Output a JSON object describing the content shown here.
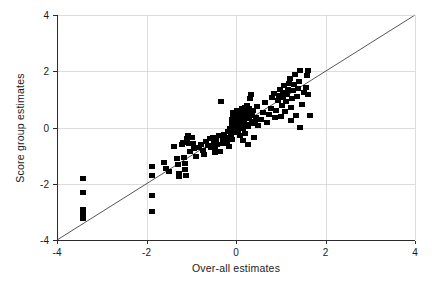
{
  "chart_data": {
    "type": "scatter",
    "title": "",
    "xlabel": "Over-all estimates",
    "ylabel": "Score group estimates",
    "xlim": [
      -4,
      4
    ],
    "ylim": [
      -4,
      4
    ],
    "xticks": [
      -4,
      -2,
      0,
      2,
      4
    ],
    "yticks": [
      -4,
      -2,
      0,
      2,
      4
    ],
    "xtick_labels": [
      "-4",
      "-2",
      "0",
      "2",
      "4"
    ],
    "ytick_labels": [
      "-4",
      "-2",
      "0",
      "2",
      "4"
    ],
    "grid": true,
    "grid_axes": "both",
    "legend": null,
    "legend_position": "none",
    "marker": "square",
    "marker_color": "#000000",
    "marker_size_px": 6,
    "reference_line": {
      "name": "identity-line",
      "type": "line",
      "slope": 1,
      "intercept": 0,
      "from": [
        -4,
        -4
      ],
      "to": [
        4,
        4
      ],
      "color": "#2b2b2b"
    },
    "series": [
      {
        "name": "estimates",
        "points": [
          [
            -3.42,
            -1.83
          ],
          [
            -3.42,
            -2.3
          ],
          [
            -3.42,
            -2.92
          ],
          [
            -3.42,
            -3.08
          ],
          [
            -3.42,
            -3.22
          ],
          [
            -1.87,
            -1.4
          ],
          [
            -1.87,
            -1.72
          ],
          [
            -1.87,
            -2.41
          ],
          [
            -1.87,
            -3.0
          ],
          [
            -1.6,
            -1.23
          ],
          [
            -1.56,
            -1.46
          ],
          [
            -1.49,
            -1.56
          ],
          [
            -1.38,
            -0.68
          ],
          [
            -1.31,
            -1.1
          ],
          [
            -1.29,
            -1.3
          ],
          [
            -1.27,
            -1.62
          ],
          [
            -1.27,
            -1.74
          ],
          [
            -1.2,
            -0.62
          ],
          [
            -1.18,
            -0.52
          ],
          [
            -1.16,
            -1.08
          ],
          [
            -1.14,
            -1.28
          ],
          [
            -1.13,
            -1.5
          ],
          [
            -1.12,
            -1.7
          ],
          [
            -1.09,
            -0.38
          ],
          [
            -1.07,
            -0.3
          ],
          [
            -1.05,
            -0.58
          ],
          [
            -1.02,
            -0.86
          ],
          [
            -0.98,
            -0.34
          ],
          [
            -0.96,
            -0.56
          ],
          [
            -0.93,
            -0.74
          ],
          [
            -0.9,
            -1.02
          ],
          [
            -0.82,
            -0.72
          ],
          [
            -0.78,
            -0.6
          ],
          [
            -0.74,
            -0.82
          ],
          [
            -0.71,
            -0.95
          ],
          [
            -0.66,
            -0.48
          ],
          [
            -0.62,
            -0.64
          ],
          [
            -0.58,
            -0.4
          ],
          [
            -0.56,
            -0.7
          ],
          [
            -0.52,
            -0.36
          ],
          [
            -0.5,
            -0.52
          ],
          [
            -0.48,
            -0.78
          ],
          [
            -0.46,
            -0.9
          ],
          [
            -0.44,
            -0.44
          ],
          [
            -0.42,
            -0.62
          ],
          [
            -0.38,
            -0.3
          ],
          [
            -0.36,
            -0.86
          ],
          [
            -0.34,
            0.92
          ],
          [
            -0.3,
            -0.42
          ],
          [
            -0.28,
            -0.58
          ],
          [
            -0.26,
            -0.24
          ],
          [
            -0.22,
            -0.36
          ],
          [
            -0.2,
            -0.5
          ],
          [
            -0.18,
            -0.14
          ],
          [
            -0.16,
            -0.66
          ],
          [
            -0.14,
            -0.02
          ],
          [
            -0.12,
            -0.28
          ],
          [
            -0.1,
            0.12
          ],
          [
            -0.09,
            -0.44
          ],
          [
            -0.08,
            0.28
          ],
          [
            -0.07,
            0.42
          ],
          [
            -0.06,
            0.52
          ],
          [
            -0.05,
            -0.18
          ],
          [
            -0.04,
            0.06
          ],
          [
            -0.03,
            0.22
          ],
          [
            -0.02,
            0.36
          ],
          [
            -0.01,
            -0.08
          ],
          [
            0.0,
            0.18
          ],
          [
            0.01,
            0.46
          ],
          [
            0.02,
            0.3
          ],
          [
            0.03,
            0.62
          ],
          [
            0.04,
            -0.12
          ],
          [
            0.05,
            0.08
          ],
          [
            0.06,
            0.24
          ],
          [
            0.07,
            0.4
          ],
          [
            0.08,
            0.56
          ],
          [
            0.09,
            -0.3
          ],
          [
            0.1,
            0.02
          ],
          [
            0.11,
            0.16
          ],
          [
            0.12,
            0.34
          ],
          [
            0.13,
            0.5
          ],
          [
            0.14,
            0.66
          ],
          [
            0.15,
            -0.46
          ],
          [
            0.16,
            -0.02
          ],
          [
            0.17,
            0.26
          ],
          [
            0.18,
            0.44
          ],
          [
            0.19,
            0.58
          ],
          [
            0.2,
            0.72
          ],
          [
            0.21,
            -0.2
          ],
          [
            0.22,
            0.1
          ],
          [
            0.23,
            0.38
          ],
          [
            0.24,
            0.54
          ],
          [
            0.25,
            0.8
          ],
          [
            0.26,
            -0.6
          ],
          [
            0.27,
            0.04
          ],
          [
            0.28,
            0.32
          ],
          [
            0.29,
            0.48
          ],
          [
            0.3,
            0.68
          ],
          [
            0.31,
            1.02
          ],
          [
            0.33,
            1.18
          ],
          [
            0.35,
            0.14
          ],
          [
            0.36,
            0.42
          ],
          [
            0.38,
            0.6
          ],
          [
            0.4,
            -0.34
          ],
          [
            0.42,
            0.2
          ],
          [
            0.44,
            0.36
          ],
          [
            0.46,
            0.74
          ],
          [
            0.5,
            0.06
          ],
          [
            0.55,
            0.3
          ],
          [
            0.6,
            0.52
          ],
          [
            0.64,
            0.88
          ],
          [
            0.7,
            0.18
          ],
          [
            0.74,
            0.46
          ],
          [
            0.78,
            0.68
          ],
          [
            0.8,
            1.08
          ],
          [
            0.84,
            1.22
          ],
          [
            0.88,
            0.34
          ],
          [
            0.9,
            0.62
          ],
          [
            0.94,
            0.96
          ],
          [
            0.96,
            1.14
          ],
          [
            0.98,
            1.36
          ],
          [
            1.0,
            0.4
          ],
          [
            1.02,
            0.78
          ],
          [
            1.04,
            1.06
          ],
          [
            1.06,
            1.26
          ],
          [
            1.08,
            1.48
          ],
          [
            1.1,
            0.58
          ],
          [
            1.12,
            0.92
          ],
          [
            1.14,
            1.16
          ],
          [
            1.16,
            1.34
          ],
          [
            1.18,
            1.58
          ],
          [
            1.2,
            1.74
          ],
          [
            1.22,
            0.26
          ],
          [
            1.24,
            0.7
          ],
          [
            1.26,
            1.04
          ],
          [
            1.28,
            1.3
          ],
          [
            1.3,
            1.52
          ],
          [
            1.32,
            1.88
          ],
          [
            1.34,
            0.44
          ],
          [
            1.36,
            1.12
          ],
          [
            1.38,
            1.4
          ],
          [
            1.4,
            1.64
          ],
          [
            1.42,
            2.04
          ],
          [
            1.44,
            0.0
          ],
          [
            1.48,
            0.82
          ],
          [
            1.52,
            1.24
          ],
          [
            1.56,
            1.44
          ],
          [
            1.58,
            1.86
          ],
          [
            1.6,
            2.02
          ],
          [
            1.62,
            1.18
          ],
          [
            1.66,
            0.42
          ]
        ]
      }
    ]
  },
  "axes": {
    "x_title": "Over-all estimates",
    "y_title": "Score group estimates"
  }
}
